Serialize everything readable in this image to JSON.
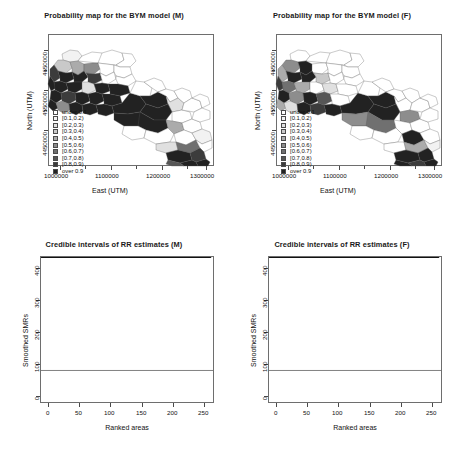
{
  "figure": {
    "background": "#ffffff",
    "panel_count": 4
  },
  "palette": {
    "legend_bins": [
      "#ffffff",
      "#f2f2f2",
      "#e0e0e0",
      "#c9c9c9",
      "#ababab",
      "#8d8d8d",
      "#707070",
      "#565656",
      "#3c3c3c",
      "#222222"
    ],
    "map_outline": "#555555",
    "frame": "#6e6e6e",
    "error_bar": "#9a9a9a",
    "point": "#111111",
    "reference_line": "#2b2b2b"
  },
  "panels": [
    {
      "id": "map-male",
      "title": "Probability map for the BYM model (M)",
      "xlabel": "East (UTM)",
      "ylabel": "North (UTM)",
      "xticks": [
        "1000000",
        "1100000",
        "1200000",
        "1300000"
      ],
      "xtick_values": [
        1000000,
        1100000,
        1200000,
        1300000
      ],
      "yticks": [
        "4650000",
        "4550000",
        "4450000"
      ],
      "ytick_values": [
        4650000,
        4550000,
        4450000
      ],
      "legend_title": "",
      "legend_items": [
        {
          "label": "under 0.1",
          "color": "#ffffff"
        },
        {
          "label": "[0.1,0.2)",
          "color": "#f2f2f2"
        },
        {
          "label": "[0.2,0.3)",
          "color": "#e0e0e0"
        },
        {
          "label": "[0.3,0.4)",
          "color": "#c9c9c9"
        },
        {
          "label": "[0.4,0.5)",
          "color": "#ababab"
        },
        {
          "label": "[0.5,0.6)",
          "color": "#8d8d8d"
        },
        {
          "label": "[0.6,0.7)",
          "color": "#707070"
        },
        {
          "label": "[0.7,0.8)",
          "color": "#565656"
        },
        {
          "label": "[0.8,0.9)",
          "color": "#3c3c3c"
        },
        {
          "label": "over 0.9",
          "color": "#222222"
        }
      ]
    },
    {
      "id": "map-female",
      "title": "Probability map for the BYM model (F)",
      "xlabel": "East (UTM)",
      "ylabel": "North (UTM)",
      "xticks": [
        "1000000",
        "1100000",
        "1200000",
        "1300000"
      ],
      "xtick_values": [
        1000000,
        1100000,
        1200000,
        1300000
      ],
      "yticks": [
        "4650000",
        "4550000",
        "4450000"
      ],
      "ytick_values": [
        4650000,
        4550000,
        4450000
      ],
      "legend_title": "",
      "legend_items": [
        {
          "label": "under 0.1",
          "color": "#ffffff"
        },
        {
          "label": "[0.1,0.2)",
          "color": "#f2f2f2"
        },
        {
          "label": "[0.2,0.3)",
          "color": "#e0e0e0"
        },
        {
          "label": "[0.3,0.4)",
          "color": "#c9c9c9"
        },
        {
          "label": "[0.4,0.5)",
          "color": "#ababab"
        },
        {
          "label": "[0.5,0.6)",
          "color": "#8d8d8d"
        },
        {
          "label": "[0.6,0.7)",
          "color": "#707070"
        },
        {
          "label": "[0.7,0.8)",
          "color": "#565656"
        },
        {
          "label": "[0.8,0.9)",
          "color": "#3c3c3c"
        },
        {
          "label": "over 0.9",
          "color": "#222222"
        }
      ]
    },
    {
      "id": "ci-male",
      "title": "Credible intervals of RR estimates (M)",
      "xlabel": "Ranked areas",
      "ylabel": "Smoothed SMRs",
      "xticks": [
        "0",
        "50",
        "100",
        "150",
        "200",
        "250"
      ],
      "yticks": [
        "0",
        "100",
        "200",
        "300",
        "400"
      ]
    },
    {
      "id": "ci-female",
      "title": "Credible intervals of RR estimates (F)",
      "xlabel": "Ranked areas",
      "ylabel": "Smoothed SMRs",
      "xticks": [
        "0",
        "50",
        "100",
        "150",
        "200",
        "250"
      ],
      "yticks": [
        "0",
        "100",
        "200",
        "300",
        "400"
      ]
    }
  ],
  "chart_data": [
    {
      "type": "map",
      "id": "map-male",
      "title": "Probability map for the BYM model (M)",
      "xlabel": "East (UTM)",
      "ylabel": "North (UTM)",
      "xlim": [
        975000,
        1320000
      ],
      "ylim": [
        4415000,
        4685000
      ],
      "xticks": [
        1000000,
        1100000,
        1200000,
        1300000
      ],
      "yticks": [
        4450000,
        4550000,
        4650000
      ],
      "region": "Puglia, Italy (municipality polygons)",
      "grid": false,
      "legend_position": "inside-left",
      "bins": [
        "under 0.1",
        "[0.1,0.2)",
        "[0.2,0.3)",
        "[0.3,0.4)",
        "[0.4,0.5)",
        "[0.5,0.6)",
        "[0.6,0.7)",
        "[0.7,0.8)",
        "[0.8,0.9)",
        "over 0.9"
      ],
      "bin_colors": [
        "#ffffff",
        "#f2f2f2",
        "#e0e0e0",
        "#c9c9c9",
        "#ababab",
        "#8d8d8d",
        "#707070",
        "#565656",
        "#3c3c3c",
        "#222222"
      ],
      "bin_counts": [
        96,
        14,
        11,
        9,
        8,
        8,
        9,
        11,
        15,
        77
      ]
    },
    {
      "type": "map",
      "id": "map-female",
      "title": "Probability map for the BYM model (F)",
      "xlabel": "East (UTM)",
      "ylabel": "North (UTM)",
      "xlim": [
        975000,
        1320000
      ],
      "ylim": [
        4415000,
        4685000
      ],
      "xticks": [
        1000000,
        1100000,
        1200000,
        1300000
      ],
      "yticks": [
        4450000,
        4550000,
        4650000
      ],
      "region": "Puglia, Italy (municipality polygons)",
      "grid": false,
      "legend_position": "inside-left",
      "bins": [
        "under 0.1",
        "[0.1,0.2)",
        "[0.2,0.3)",
        "[0.3,0.4)",
        "[0.4,0.5)",
        "[0.5,0.6)",
        "[0.6,0.7)",
        "[0.7,0.8)",
        "[0.8,0.9)",
        "over 0.9"
      ],
      "bin_colors": [
        "#ffffff",
        "#f2f2f2",
        "#e0e0e0",
        "#c9c9c9",
        "#ababab",
        "#8d8d8d",
        "#707070",
        "#565656",
        "#3c3c3c",
        "#222222"
      ],
      "bin_counts": [
        103,
        15,
        12,
        10,
        9,
        8,
        9,
        12,
        14,
        66
      ]
    },
    {
      "type": "scatter",
      "id": "ci-male",
      "title": "Credible intervals of RR estimates (M)",
      "xlabel": "Ranked areas",
      "ylabel": "Smoothed SMRs",
      "xlim": [
        0,
        262
      ],
      "ylim": [
        0,
        460
      ],
      "xticks": [
        0,
        50,
        100,
        150,
        200,
        250
      ],
      "yticks": [
        0,
        100,
        200,
        300,
        400
      ],
      "grid": false,
      "legend_position": "none",
      "reference_line_y": 100,
      "n_points": 258,
      "series": [
        {
          "name": "Smoothed SMR (posterior median)",
          "marker": "filled-circle",
          "color": "#111111",
          "x": [
            1,
            6,
            11,
            16,
            21,
            26,
            31,
            36,
            41,
            46,
            51,
            56,
            61,
            66,
            71,
            76,
            81,
            86,
            91,
            96,
            101,
            106,
            111,
            116,
            121,
            126,
            131,
            136,
            141,
            146,
            151,
            156,
            161,
            166,
            171,
            176,
            181,
            186,
            191,
            196,
            201,
            206,
            211,
            216,
            221,
            226,
            231,
            236,
            241,
            246,
            249,
            252,
            254,
            255,
            256,
            257,
            258
          ],
          "values": [
            46,
            52,
            56,
            59,
            62,
            64,
            66,
            68,
            70,
            71,
            73,
            74,
            76,
            77,
            78,
            79,
            81,
            82,
            83,
            84,
            85,
            86,
            87,
            88,
            89,
            90,
            91,
            92,
            93,
            94,
            95,
            96,
            97,
            98,
            99,
            101,
            102,
            104,
            106,
            108,
            111,
            114,
            118,
            123,
            129,
            137,
            147,
            160,
            175,
            192,
            200,
            210,
            225,
            238,
            246,
            255,
            264
          ]
        },
        {
          "name": "95% credible interval lower bound",
          "marker": "error-bar-lower",
          "color": "#9a9a9a",
          "values": [
            24,
            28,
            31,
            33,
            35,
            37,
            39,
            40,
            42,
            43,
            44,
            45,
            46,
            47,
            48,
            49,
            50,
            51,
            52,
            53,
            53,
            54,
            55,
            56,
            56,
            57,
            58,
            58,
            59,
            60,
            60,
            61,
            62,
            62,
            63,
            64,
            65,
            66,
            67,
            68,
            70,
            72,
            74,
            77,
            81,
            86,
            92,
            100,
            110,
            121,
            126,
            132,
            141,
            149,
            154,
            159,
            164
          ]
        },
        {
          "name": "95% credible interval upper bound",
          "marker": "error-bar-upper",
          "color": "#9a9a9a",
          "values": [
            82,
            90,
            95,
            99,
            103,
            106,
            109,
            112,
            114,
            116,
            118,
            120,
            122,
            124,
            125,
            127,
            128,
            130,
            131,
            133,
            134,
            136,
            137,
            139,
            140,
            142,
            143,
            145,
            146,
            148,
            150,
            151,
            153,
            155,
            157,
            159,
            161,
            164,
            167,
            171,
            176,
            182,
            189,
            198,
            208,
            221,
            236,
            256,
            280,
            307,
            320,
            336,
            360,
            380,
            393,
            408,
            450
          ]
        }
      ]
    },
    {
      "type": "scatter",
      "id": "ci-female",
      "title": "Credible intervals of RR estimates (F)",
      "xlabel": "Ranked areas",
      "ylabel": "Smoothed SMRs",
      "xlim": [
        0,
        262
      ],
      "ylim": [
        0,
        460
      ],
      "xticks": [
        0,
        50,
        100,
        150,
        200,
        250
      ],
      "yticks": [
        0,
        100,
        200,
        300,
        400
      ],
      "grid": false,
      "legend_position": "none",
      "reference_line_y": 100,
      "n_points": 258,
      "series": [
        {
          "name": "Smoothed SMR (posterior median)",
          "marker": "filled-circle",
          "color": "#111111",
          "x": [
            1,
            6,
            11,
            16,
            21,
            26,
            31,
            36,
            41,
            46,
            51,
            56,
            61,
            66,
            71,
            76,
            81,
            86,
            91,
            96,
            101,
            106,
            111,
            116,
            121,
            126,
            131,
            136,
            141,
            146,
            151,
            156,
            161,
            166,
            171,
            176,
            181,
            186,
            191,
            196,
            201,
            206,
            211,
            216,
            221,
            226,
            231,
            236,
            241,
            246,
            249,
            252,
            254,
            255,
            256,
            257,
            258
          ],
          "values": [
            60,
            65,
            68,
            70,
            72,
            73,
            75,
            76,
            77,
            78,
            79,
            80,
            81,
            82,
            83,
            84,
            85,
            86,
            86,
            87,
            88,
            89,
            90,
            90,
            91,
            92,
            93,
            94,
            95,
            96,
            97,
            98,
            99,
            100,
            101,
            103,
            104,
            106,
            108,
            110,
            113,
            116,
            120,
            125,
            130,
            137,
            145,
            154,
            163,
            172,
            177,
            182,
            186,
            188,
            190,
            192,
            194
          ]
        },
        {
          "name": "95% credible interval lower bound",
          "marker": "error-bar-lower",
          "color": "#9a9a9a",
          "values": [
            33,
            37,
            40,
            42,
            43,
            45,
            46,
            47,
            48,
            49,
            50,
            50,
            51,
            52,
            52,
            53,
            54,
            54,
            55,
            55,
            56,
            56,
            57,
            57,
            58,
            58,
            59,
            59,
            60,
            61,
            61,
            62,
            63,
            63,
            64,
            65,
            66,
            67,
            68,
            70,
            72,
            74,
            77,
            80,
            84,
            88,
            94,
            100,
            107,
            114,
            118,
            122,
            125,
            127,
            128,
            130,
            132
          ]
        },
        {
          "name": "95% credible interval upper bound",
          "marker": "error-bar-upper",
          "color": "#9a9a9a",
          "values": [
            100,
            107,
            112,
            115,
            118,
            120,
            122,
            124,
            125,
            127,
            128,
            130,
            131,
            132,
            133,
            135,
            136,
            137,
            138,
            139,
            140,
            142,
            143,
            144,
            145,
            147,
            148,
            150,
            151,
            153,
            155,
            157,
            159,
            161,
            163,
            166,
            169,
            172,
            176,
            181,
            186,
            192,
            200,
            209,
            219,
            231,
            245,
            261,
            277,
            292,
            300,
            309,
            314,
            318,
            322,
            328,
            340
          ]
        }
      ]
    }
  ]
}
